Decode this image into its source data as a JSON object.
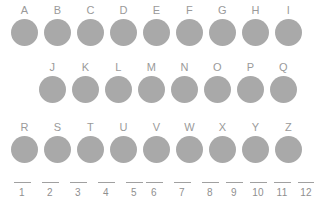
{
  "page": {
    "background_color": "#ffffff",
    "dot_color": "#a9a9a9",
    "label_color": "#9a9a9a",
    "ruler_color": "#a0a0a0"
  },
  "rows": [
    {
      "name": "row-1",
      "left": 8,
      "top": 5,
      "pitch": 33,
      "labels": [
        "A",
        "B",
        "C",
        "D",
        "E",
        "F",
        "G",
        "H",
        "I"
      ]
    },
    {
      "name": "row-2",
      "left": 36,
      "top": 62,
      "pitch": 33,
      "labels": [
        "J",
        "K",
        "L",
        "M",
        "N",
        "O",
        "P",
        "Q"
      ]
    },
    {
      "name": "row-3",
      "left": 8,
      "top": 122,
      "pitch": 33,
      "labels": [
        "R",
        "S",
        "T",
        "U",
        "V",
        "W",
        "X",
        "Y",
        "Z"
      ]
    }
  ],
  "ruler": {
    "groups": [
      {
        "name": "ruler-group-1",
        "left": 8,
        "pitch": 28,
        "labels": [
          "1",
          "2",
          "3",
          "4",
          "5"
        ]
      },
      {
        "name": "ruler-group-2",
        "left": 140,
        "pitch": 28,
        "labels": [
          "6",
          "7",
          "8"
        ]
      },
      {
        "name": "ruler-group-3",
        "left": 222,
        "pitch": 24,
        "labels": [
          "9",
          "10",
          "11",
          "12"
        ]
      }
    ]
  }
}
